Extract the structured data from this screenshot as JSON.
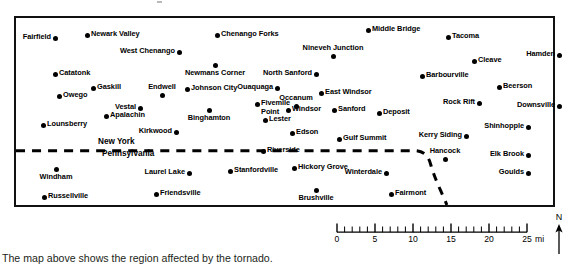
{
  "caption": "The map above shows the region affected by the tornado.",
  "map": {
    "state_labels": [
      {
        "name": "New York",
        "x": 96,
        "y": 124
      },
      {
        "name": "Pennsylvania",
        "x": 100,
        "y": 136
      }
    ],
    "towns": [
      {
        "name": "Fairfield",
        "x": 39,
        "y": 20,
        "pos": "l"
      },
      {
        "name": "Newark Valley",
        "x": 71,
        "y": 17,
        "pos": "r"
      },
      {
        "name": "Chenango Forks",
        "x": 201,
        "y": 17,
        "pos": "r"
      },
      {
        "name": "Middle Bridge",
        "x": 352,
        "y": 12,
        "pos": "r"
      },
      {
        "name": "Tacoma",
        "x": 432,
        "y": 19,
        "pos": "r"
      },
      {
        "name": "West Chenango",
        "x": 163,
        "y": 34,
        "pos": "l"
      },
      {
        "name": "Nineveh Junction",
        "x": 317,
        "y": 38,
        "pos": "t"
      },
      {
        "name": "Cleave",
        "x": 458,
        "y": 43,
        "pos": "r"
      },
      {
        "name": "Hamden",
        "x": 543,
        "y": 37,
        "pos": "l"
      },
      {
        "name": "Newmans Corner",
        "x": 199,
        "y": 47,
        "pos": "b"
      },
      {
        "name": "Catatonk",
        "x": 39,
        "y": 56,
        "pos": "r"
      },
      {
        "name": "North Sanford",
        "x": 300,
        "y": 56,
        "pos": "l"
      },
      {
        "name": "Barbourville",
        "x": 406,
        "y": 58,
        "pos": "r"
      },
      {
        "name": "Beerson",
        "x": 483,
        "y": 69,
        "pos": "r"
      },
      {
        "name": "Gaskill",
        "x": 77,
        "y": 70,
        "pos": "r"
      },
      {
        "name": "Endwell",
        "x": 146,
        "y": 77,
        "pos": "t"
      },
      {
        "name": "Johnson City",
        "x": 171,
        "y": 71,
        "pos": "r"
      },
      {
        "name": "Ouaquaga",
        "x": 261,
        "y": 70,
        "pos": "l"
      },
      {
        "name": "Owego",
        "x": 43,
        "y": 78,
        "pos": "r"
      },
      {
        "name": "East Windsor",
        "x": 305,
        "y": 75,
        "pos": "r"
      },
      {
        "name": "Occanum",
        "x": 280,
        "y": 88,
        "pos": "t"
      },
      {
        "name": "Rock Rift",
        "x": 463,
        "y": 85,
        "pos": "l"
      },
      {
        "name": "Downsville",
        "x": 543,
        "y": 88,
        "pos": "l"
      },
      {
        "name": "Vestal",
        "x": 124,
        "y": 90,
        "pos": "l"
      },
      {
        "name": "Fivemile\nPoint",
        "x": 241,
        "y": 86,
        "pos": "r"
      },
      {
        "name": "Windsor",
        "x": 272,
        "y": 92,
        "pos": "r"
      },
      {
        "name": "Sanford",
        "x": 318,
        "y": 92,
        "pos": "r"
      },
      {
        "name": "Deposit",
        "x": 363,
        "y": 95,
        "pos": "r"
      },
      {
        "name": "Binghamton",
        "x": 193,
        "y": 92,
        "pos": "b"
      },
      {
        "name": "Apalachin",
        "x": 90,
        "y": 98,
        "pos": "r"
      },
      {
        "name": "Lester",
        "x": 249,
        "y": 102,
        "pos": "r"
      },
      {
        "name": "Lounsberry",
        "x": 27,
        "y": 107,
        "pos": "r"
      },
      {
        "name": "Shinhopple",
        "x": 512,
        "y": 109,
        "pos": "l"
      },
      {
        "name": "Kirkwood",
        "x": 160,
        "y": 114,
        "pos": "l"
      },
      {
        "name": "Edson",
        "x": 276,
        "y": 115,
        "pos": "r"
      },
      {
        "name": "Gulf Summit",
        "x": 323,
        "y": 121,
        "pos": "r"
      },
      {
        "name": "Kerry Siding",
        "x": 450,
        "y": 118,
        "pos": "l"
      },
      {
        "name": "Riverside",
        "x": 247,
        "y": 133,
        "pos": "r"
      },
      {
        "name": "Hancock",
        "x": 429,
        "y": 141,
        "pos": "t"
      },
      {
        "name": "Elk Brook",
        "x": 512,
        "y": 137,
        "pos": "l"
      },
      {
        "name": "Windham",
        "x": 40,
        "y": 151,
        "pos": "b"
      },
      {
        "name": "Laurel Lake",
        "x": 173,
        "y": 155,
        "pos": "l"
      },
      {
        "name": "Stanfordville",
        "x": 214,
        "y": 153,
        "pos": "r"
      },
      {
        "name": "Hickory Grove",
        "x": 278,
        "y": 150,
        "pos": "r"
      },
      {
        "name": "Winterdale",
        "x": 370,
        "y": 155,
        "pos": "l"
      },
      {
        "name": "Goulds",
        "x": 512,
        "y": 155,
        "pos": "l"
      },
      {
        "name": "Russellville",
        "x": 28,
        "y": 179,
        "pos": "r"
      },
      {
        "name": "Friendsville",
        "x": 140,
        "y": 176,
        "pos": "r"
      },
      {
        "name": "Brushville",
        "x": 300,
        "y": 172,
        "pos": "b"
      },
      {
        "name": "Fairmont",
        "x": 375,
        "y": 176,
        "pos": "r"
      }
    ],
    "border_style": "dashed-state-line"
  },
  "scale": {
    "unit_label": "mi",
    "ticks": [
      0,
      5,
      10,
      15,
      20,
      25
    ],
    "tick_labels": [
      "0",
      "5",
      "10",
      "15",
      "20",
      "25"
    ],
    "minor_tick_interval": 1,
    "max": 25
  },
  "compass": {
    "north_label": "N",
    "icon": "north-arrow-icon"
  }
}
